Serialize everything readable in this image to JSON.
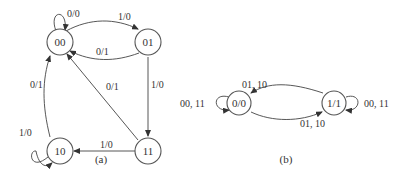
{
  "diagram_a": {
    "caption": "(a)",
    "states": [
      {
        "id": "s00",
        "label": "00"
      },
      {
        "id": "s01",
        "label": "01"
      },
      {
        "id": "s10",
        "label": "10"
      },
      {
        "id": "s11",
        "label": "11"
      }
    ],
    "transitions": [
      {
        "from": "00",
        "to": "00",
        "label": "0/0"
      },
      {
        "from": "00",
        "to": "01",
        "label": "1/0"
      },
      {
        "from": "01",
        "to": "00",
        "label": "0/1"
      },
      {
        "from": "01",
        "to": "11",
        "label": "1/0"
      },
      {
        "from": "11",
        "to": "00",
        "label": "0/1"
      },
      {
        "from": "11",
        "to": "10",
        "label": "1/0"
      },
      {
        "from": "10",
        "to": "00",
        "label": "0/1"
      },
      {
        "from": "10",
        "to": "10",
        "label": "1/0"
      }
    ]
  },
  "diagram_b": {
    "caption": "(b)",
    "states": [
      {
        "id": "s0",
        "label": "0/0"
      },
      {
        "id": "s1",
        "label": "1/1"
      }
    ],
    "transitions": [
      {
        "from": "0/0",
        "to": "0/0",
        "label": "00, 11"
      },
      {
        "from": "1/1",
        "to": "0/0",
        "label": "01, 10"
      },
      {
        "from": "0/0",
        "to": "1/1",
        "label": "01, 10"
      },
      {
        "from": "1/1",
        "to": "1/1",
        "label": "00, 11"
      }
    ]
  }
}
